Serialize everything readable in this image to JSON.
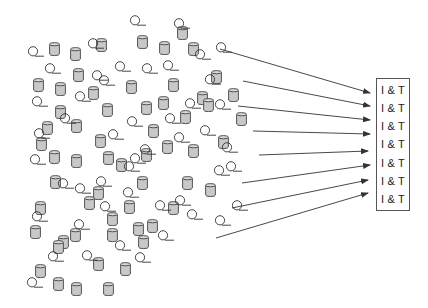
{
  "diagram": {
    "colors": {
      "cylinder_fill": "#c8c8c8",
      "cylinder_stroke": "#444444",
      "coil_stroke": "#333333",
      "arrow": "#333333",
      "box_border": "#555555",
      "text": "#222222"
    },
    "target_box": {
      "labels": [
        "I & T",
        "I & T",
        "I & T",
        "I & T",
        "I & T",
        "I & T",
        "I & T"
      ]
    },
    "arrows": [
      {
        "x1": 220,
        "y1": 49,
        "x2": 370,
        "y2": 93
      },
      {
        "x1": 243,
        "y1": 81,
        "x2": 370,
        "y2": 106
      },
      {
        "x1": 238,
        "y1": 106,
        "x2": 370,
        "y2": 120
      },
      {
        "x1": 253,
        "y1": 131,
        "x2": 370,
        "y2": 134
      },
      {
        "x1": 259,
        "y1": 155,
        "x2": 368,
        "y2": 151
      },
      {
        "x1": 242,
        "y1": 183,
        "x2": 370,
        "y2": 165
      },
      {
        "x1": 232,
        "y1": 208,
        "x2": 368,
        "y2": 180
      },
      {
        "x1": 216,
        "y1": 238,
        "x2": 368,
        "y2": 193
      }
    ],
    "cylinders": [
      [
        49,
        42
      ],
      [
        70,
        47
      ],
      [
        96,
        38
      ],
      [
        137,
        35
      ],
      [
        159,
        41
      ],
      [
        177,
        26
      ],
      [
        188,
        42
      ],
      [
        73,
        68
      ],
      [
        33,
        78
      ],
      [
        55,
        82
      ],
      [
        88,
        86
      ],
      [
        126,
        80
      ],
      [
        168,
        78
      ],
      [
        141,
        101
      ],
      [
        211,
        70
      ],
      [
        102,
        103
      ],
      [
        55,
        105
      ],
      [
        71,
        119
      ],
      [
        158,
        96
      ],
      [
        228,
        88
      ],
      [
        42,
        121
      ],
      [
        148,
        124
      ],
      [
        180,
        110
      ],
      [
        197,
        91
      ],
      [
        203,
        98
      ],
      [
        36,
        137
      ],
      [
        95,
        134
      ],
      [
        162,
        140
      ],
      [
        141,
        148
      ],
      [
        49,
        150
      ],
      [
        71,
        154
      ],
      [
        103,
        151
      ],
      [
        218,
        135
      ],
      [
        236,
        112
      ],
      [
        116,
        158
      ],
      [
        188,
        144
      ],
      [
        50,
        175
      ],
      [
        93,
        186
      ],
      [
        137,
        176
      ],
      [
        182,
        176
      ],
      [
        205,
        183
      ],
      [
        84,
        196
      ],
      [
        124,
        200
      ],
      [
        168,
        201
      ],
      [
        147,
        219
      ],
      [
        107,
        228
      ],
      [
        35,
        201
      ],
      [
        107,
        212
      ],
      [
        58,
        235
      ],
      [
        70,
        228
      ],
      [
        35,
        264
      ],
      [
        53,
        240
      ],
      [
        93,
        257
      ],
      [
        71,
        282
      ],
      [
        103,
        282
      ],
      [
        53,
        277
      ],
      [
        120,
        262
      ],
      [
        138,
        235
      ],
      [
        133,
        222
      ],
      [
        30,
        225
      ]
    ],
    "coils": [
      [
        28,
        46
      ],
      [
        88,
        38
      ],
      [
        130,
        15
      ],
      [
        174,
        18
      ],
      [
        45,
        63
      ],
      [
        115,
        61
      ],
      [
        92,
        70
      ],
      [
        142,
        63
      ],
      [
        216,
        42
      ],
      [
        195,
        49
      ],
      [
        163,
        60
      ],
      [
        99,
        75
      ],
      [
        205,
        74
      ],
      [
        32,
        96
      ],
      [
        75,
        91
      ],
      [
        185,
        98
      ],
      [
        60,
        113
      ],
      [
        127,
        116
      ],
      [
        165,
        113
      ],
      [
        215,
        99
      ],
      [
        200,
        125
      ],
      [
        34,
        128
      ],
      [
        108,
        129
      ],
      [
        222,
        142
      ],
      [
        140,
        144
      ],
      [
        174,
        132
      ],
      [
        58,
        178
      ],
      [
        75,
        183
      ],
      [
        130,
        153
      ],
      [
        30,
        154
      ],
      [
        96,
        176
      ],
      [
        124,
        161
      ],
      [
        214,
        165
      ],
      [
        175,
        195
      ],
      [
        32,
        211
      ],
      [
        100,
        201
      ],
      [
        187,
        209
      ],
      [
        74,
        219
      ],
      [
        155,
        200
      ],
      [
        123,
        187
      ],
      [
        82,
        250
      ],
      [
        135,
        252
      ],
      [
        48,
        251
      ],
      [
        27,
        277
      ],
      [
        115,
        240
      ],
      [
        215,
        215
      ],
      [
        158,
        230
      ],
      [
        226,
        161
      ],
      [
        232,
        200
      ]
    ]
  }
}
